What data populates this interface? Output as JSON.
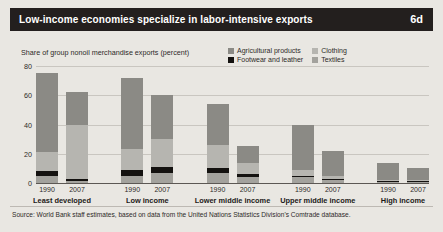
{
  "header": {
    "title": "Low-income economies specialize in labor-intensive exports",
    "figure_number": "6d"
  },
  "source": {
    "text": "Source: World Bank staff estimates, based on data from the United Nations Statistics Division's Comtrade database."
  },
  "colors": {
    "title_bar": "#231f1e",
    "page_background": "#e9e7e2",
    "agricultural": "#8b8a85",
    "clothing": "#b6b5b0",
    "footwear": "#141210",
    "textiles": "#a3a29d",
    "gridline": "#c9c6c0",
    "axis": "#5c5854",
    "text": "#2d2a28"
  },
  "legend": {
    "items": [
      {
        "label": "Agricultural products",
        "key": "agricultural",
        "swatch": "#8b8a85"
      },
      {
        "label": "Clothing",
        "key": "clothing",
        "swatch": "#b6b5b0"
      },
      {
        "label": "Footwear and leather",
        "key": "footwear",
        "swatch": "#141210"
      },
      {
        "label": "Textiles",
        "key": "textiles",
        "swatch": "#a3a29d"
      }
    ]
  },
  "chart_data": {
    "type": "bar",
    "subtype": "stacked",
    "title": "Low-income economies specialize in labor-intensive exports",
    "ylabel": "Share of group nonoil merchandise exports (percent)",
    "xlabel": "",
    "ylim": [
      0,
      80
    ],
    "yticks": [
      0,
      20,
      40,
      60,
      80
    ],
    "ytick_labels": [
      "0",
      "20",
      "40",
      "60",
      "80"
    ],
    "grid": true,
    "legend_position": "top-right",
    "groups": [
      "Least developed",
      "Low income",
      "Lower middle income",
      "Upper middle income",
      "High income"
    ],
    "years": [
      "1990",
      "2007"
    ],
    "categories": [
      "Least developed 1990",
      "Least developed 2007",
      "Low income 1990",
      "Low income 2007",
      "Lower middle income 1990",
      "Lower middle income 2007",
      "Upper middle income 1990",
      "Upper middle income 2007",
      "High income 1990",
      "High income 2007"
    ],
    "series": [
      {
        "name": "Agricultural products",
        "color": "#8b8a85",
        "values": [
          54,
          22,
          49,
          30,
          28,
          11,
          31,
          17,
          11,
          8
        ]
      },
      {
        "name": "Clothing",
        "color": "#b6b5b0",
        "values": [
          13,
          37,
          14,
          19,
          16,
          8,
          4,
          2,
          1,
          0.6
        ]
      },
      {
        "name": "Footwear and leather",
        "color": "#141210",
        "values": [
          3,
          1.5,
          4,
          4,
          3,
          2,
          1,
          0.5,
          0.4,
          0.3
        ]
      },
      {
        "name": "Textiles",
        "color": "#a3a29d",
        "values": [
          5,
          1.5,
          5,
          7,
          7,
          4,
          4,
          2,
          0.6,
          0.4
        ]
      }
    ],
    "totals": [
      75,
      62,
      72,
      60,
      54,
      25,
      40,
      21.5,
      13,
      9.3
    ]
  },
  "axis": {
    "ylabel_caption": "Share of group nonoil merchandise exports (percent)"
  }
}
